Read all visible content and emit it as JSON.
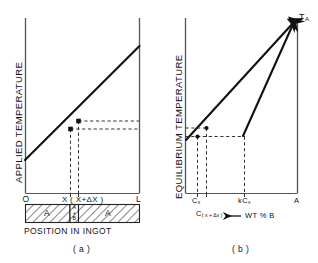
{
  "figure": {
    "caption_a": "( a )",
    "caption_b": "( b )"
  },
  "panel_a": {
    "name": "applied-temperature-vs-position",
    "y_axis_label": "APPLIED  TEMPERATURE",
    "x_axis_label": "POSITION   IN   INGOT",
    "x_ticks": [
      {
        "key": "origin",
        "label": "O"
      },
      {
        "key": "x",
        "label": "X"
      },
      {
        "key": "x_plus_dx",
        "label": "( X+ΔX )"
      },
      {
        "key": "length",
        "label": "L"
      }
    ],
    "ingot_segments": [
      {
        "key": "left",
        "label": "A"
      },
      {
        "key": "middle",
        "label": "A+B",
        "lines": [
          "A",
          "+",
          "B"
        ]
      },
      {
        "key": "right",
        "label": "A"
      }
    ],
    "markers": [
      {
        "key": "point-x",
        "label": ""
      },
      {
        "key": "point-x-plus-dx",
        "label": ""
      }
    ]
  },
  "panel_b": {
    "name": "equilibrium-temperature-vs-composition",
    "y_axis_label": "EQUILIBRIUM  TEMPERATURE",
    "x_axis_caption": "WT % B",
    "x_axis_arrow": "←",
    "apex_label": {
      "base": "T",
      "sub": "A"
    },
    "x_ticks": [
      {
        "key": "c_x",
        "base": "C",
        "sub": "x"
      },
      {
        "key": "c_x_plus_dx",
        "base": "C",
        "sub": "( x + Δx )"
      },
      {
        "key": "kc_x",
        "base": "kC",
        "sub": "x"
      },
      {
        "key": "pure_a",
        "base": "A",
        "sub": ""
      }
    ]
  },
  "colors": {
    "ink": "#111111",
    "axis": "#555555",
    "dashed": "#333333",
    "hatch": "#222222",
    "background": "#ffffff"
  }
}
